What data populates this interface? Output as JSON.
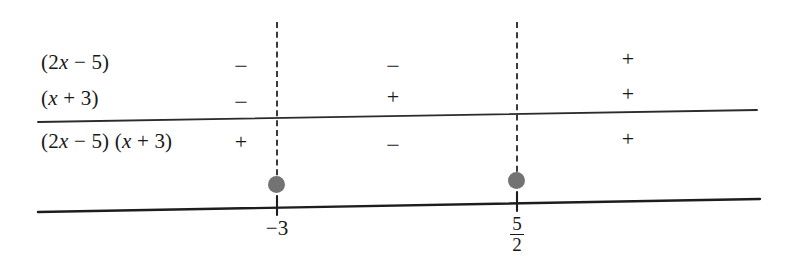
{
  "figure": {
    "type": "sign-chart",
    "colors": {
      "ink": "#181818",
      "rule": "#2b2b2b",
      "dot": "#737373",
      "background": "#ffffff"
    }
  },
  "rows": [
    {
      "label_prefix": "(2",
      "label_var": "x",
      "label_suffix": " − 5)",
      "label_plain": "(2x − 5)",
      "signs": [
        "−",
        "−",
        "+"
      ]
    },
    {
      "label_prefix": "(",
      "label_var": "x",
      "label_suffix": " + 3)",
      "label_plain": "(x + 3)",
      "signs": [
        "−",
        "+",
        "+"
      ]
    },
    {
      "label_prefix": "(2",
      "label_var": "x",
      "label_suffix": " − 5) (",
      "label_var2": "x",
      "label_suffix2": " + 3)",
      "label_plain": "(2x − 5) (x + 3)",
      "signs": [
        "+",
        "−",
        "+"
      ]
    }
  ],
  "critical_points": [
    {
      "label": "−3",
      "value": "-3",
      "display": "integer"
    },
    {
      "label": "5/2",
      "numerator": "5",
      "denominator": "2",
      "value": "2.5",
      "display": "fraction"
    }
  ],
  "intervals": [
    {
      "name": "left-interval",
      "description": "x < -3"
    },
    {
      "name": "middle-interval",
      "description": "-3 < x < 5/2"
    },
    {
      "name": "right-interval",
      "description": "x > 5/2"
    }
  ]
}
